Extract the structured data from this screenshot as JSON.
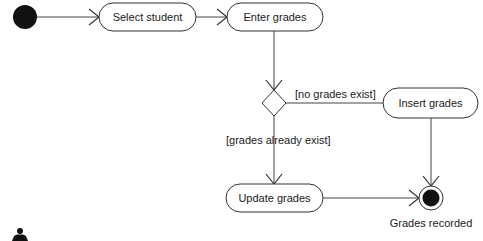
{
  "diagram": {
    "type": "uml-activity",
    "nodes": {
      "start": {
        "kind": "initial"
      },
      "select_student": {
        "kind": "action",
        "label": "Select student"
      },
      "enter_grades": {
        "kind": "action",
        "label": "Enter grades"
      },
      "decision": {
        "kind": "decision"
      },
      "insert_grades": {
        "kind": "action",
        "label": "Insert grades"
      },
      "update_grades": {
        "kind": "action",
        "label": "Update grades"
      },
      "end": {
        "kind": "final",
        "label": "Grades recorded"
      }
    },
    "guards": {
      "no_grades": "[no grades exist]",
      "grades_exist": "[grades already exist]"
    },
    "edges": [
      {
        "from": "start",
        "to": "select_student"
      },
      {
        "from": "select_student",
        "to": "enter_grades"
      },
      {
        "from": "enter_grades",
        "to": "decision"
      },
      {
        "from": "decision",
        "to": "insert_grades",
        "guard": "[no grades exist]"
      },
      {
        "from": "decision",
        "to": "update_grades",
        "guard": "[grades already exist]"
      },
      {
        "from": "insert_grades",
        "to": "end"
      },
      {
        "from": "update_grades",
        "to": "end"
      }
    ],
    "actor_icon": "person-icon"
  }
}
